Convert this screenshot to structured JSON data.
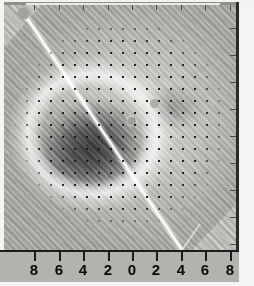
{
  "figure": {
    "title": "",
    "type": "density-plot",
    "background_color": "#f2f2f0",
    "plot_background_color": "#b8b8b4"
  },
  "chart_data": {
    "type": "heatmap",
    "title": "",
    "subtitle": "",
    "xlabel": "",
    "ylabel": "",
    "colormap": "grayscale",
    "grid": false,
    "legend": "none",
    "xlim": [
      -9,
      9
    ],
    "ylim": [
      -9,
      9
    ],
    "x_ticks": [
      -8,
      -6,
      -4,
      -2,
      0,
      2,
      4,
      6,
      8
    ],
    "x_tick_labels": [
      "8",
      "6",
      "4",
      "2",
      "0",
      "2",
      "4",
      "6",
      "8"
    ],
    "y_ticks": [
      -8,
      -6,
      -4,
      -2,
      0,
      2,
      4,
      6,
      8
    ],
    "y_tick_labels": [
      "",
      "",
      "",
      "",
      "",
      "",
      "",
      "",
      ""
    ],
    "top_axis_ticks": [
      -8,
      -6,
      -4,
      -2,
      0,
      2,
      4,
      6,
      8
    ],
    "annotations": [
      {
        "name": "origin-marker",
        "x": -8.6,
        "y": 8.8,
        "shape": "circle"
      },
      {
        "name": "origin-dot",
        "x": 0.0,
        "y": 0.1,
        "shape": "circle"
      },
      {
        "name": "secondary-dot",
        "x": 1.6,
        "y": 1.7,
        "shape": "circle"
      },
      {
        "name": "cut-line",
        "from": [
          -8.6,
          8.8
        ],
        "to": [
          6.9,
          -9.0
        ],
        "style": "bright-diagonal"
      }
    ],
    "overlay": {
      "name": "sample-point-grid",
      "spacing": 0.9,
      "marker": "dot",
      "marker_color": "#16161a",
      "domain": "circular"
    },
    "features": [
      "dark bilobed scattering core centered left of origin",
      "bright halo ring surrounding the dark core",
      "diagonal interference fringes across the full field",
      "hatched wedges in upper-left and lower-right corners"
    ]
  },
  "axis_bottom": {
    "name": "x-axis",
    "ticks": [
      {
        "label": "8",
        "x_px": 30
      },
      {
        "label": "6",
        "x_px": 55
      },
      {
        "label": "4",
        "x_px": 79
      },
      {
        "label": "2",
        "x_px": 104
      },
      {
        "label": "0",
        "x_px": 128
      },
      {
        "label": "2",
        "x_px": 152
      },
      {
        "label": "4",
        "x_px": 177
      },
      {
        "label": "6",
        "x_px": 201
      },
      {
        "label": "8",
        "x_px": 226
      }
    ]
  },
  "axis_right": {
    "name": "y-axis",
    "ticks_y_px": [
      28,
      55,
      82,
      109,
      136,
      163,
      190,
      217,
      244
    ]
  },
  "axis_top": {
    "name": "top-axis",
    "ticks_x_px": [
      30,
      55,
      79,
      104,
      128,
      152,
      177,
      201,
      226
    ]
  },
  "colors": {
    "core_dark": "#1e1e1e",
    "field_mid": "#b8b8b4",
    "field_light": "#cfcfcb",
    "halo": "#ffffff",
    "axis_line": "#1c1c1c",
    "axis_band": "#b2b2ae",
    "tick_label": "#0a0a0a",
    "dot": "#16161a",
    "page_background": "#f4f4f2"
  }
}
